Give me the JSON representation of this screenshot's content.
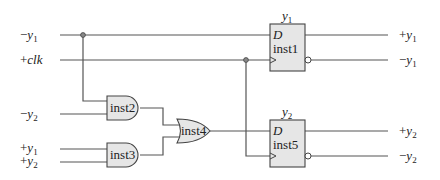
{
  "diagram": {
    "type": "logic-circuit",
    "inputs": [
      {
        "sign": "−",
        "var": "y",
        "sub": "1"
      },
      {
        "sign": "+",
        "var": "clk",
        "sub": ""
      },
      {
        "sign": "−",
        "var": "y",
        "sub": "2"
      },
      {
        "sign": "+",
        "var": "y",
        "sub": "1"
      },
      {
        "sign": "+",
        "var": "y",
        "sub": "2"
      }
    ],
    "outputs": [
      {
        "sign": "+",
        "var": "y",
        "sub": "1"
      },
      {
        "sign": "−",
        "var": "y",
        "sub": "1"
      },
      {
        "sign": "+",
        "var": "y",
        "sub": "2"
      },
      {
        "sign": "−",
        "var": "y",
        "sub": "2"
      }
    ],
    "gates": {
      "and1": "inst2",
      "and2": "inst3",
      "or1": "inst4"
    },
    "flipflops": [
      {
        "title_var": "y",
        "title_sub": "1",
        "d_label": "D",
        "name": "inst1"
      },
      {
        "title_var": "y",
        "title_sub": "2",
        "d_label": "D",
        "name": "inst5"
      }
    ]
  }
}
